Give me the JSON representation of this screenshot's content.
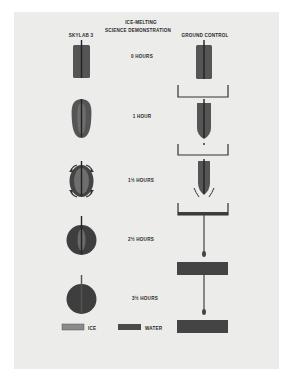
{
  "title": {
    "line1": "ICE-MELTING",
    "line2": "SCIENCE DEMONSTRATION"
  },
  "columns": {
    "left": "SKYLAB 3",
    "right": "GROUND CONTROL"
  },
  "stages": [
    {
      "label": "0 HOURS"
    },
    {
      "label": "1 HOUR"
    },
    {
      "label": "1½ HOURS"
    },
    {
      "label": "2½ HOURS"
    },
    {
      "label": "3½ HOURS"
    }
  ],
  "legend": {
    "ice_label": "ICE",
    "water_label": "WATER",
    "ice_color": "#8a8a8a",
    "water_color": "#4a4a4a"
  },
  "colors": {
    "background": "#ececea",
    "ice": "#6c6c6c",
    "water": "#3e3e3e",
    "rod": "#262626"
  }
}
